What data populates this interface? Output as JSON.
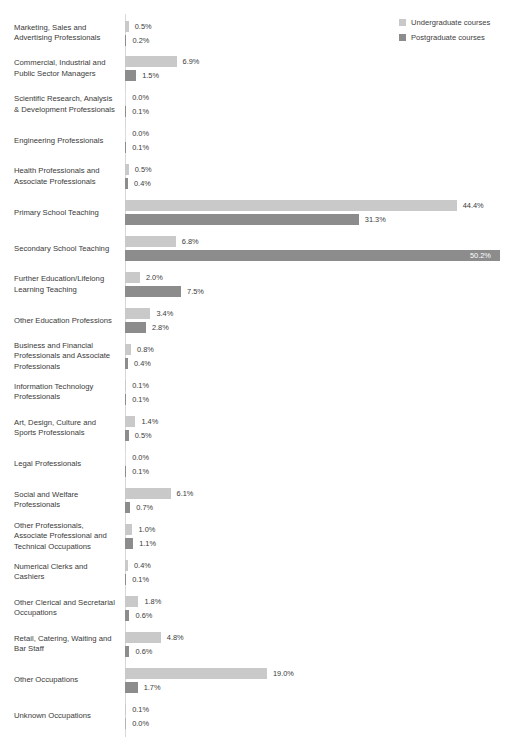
{
  "chart_data": {
    "type": "bar",
    "orientation": "horizontal",
    "title": "",
    "subtitle": "",
    "xlabel": "",
    "ylabel": "",
    "xlim": [
      0,
      50.2
    ],
    "grid": false,
    "value_suffix": "%",
    "legend_position": "top-right",
    "legend": [
      "Undergraduate courses",
      "Postgraduate courses"
    ],
    "colors": {
      "undergraduate": "#c9c9c9",
      "postgraduate": "#8c8c8c",
      "label_text": "#3a3a3a",
      "axis_line": "#d8d8d8",
      "inside_label_text": "#ffffff"
    },
    "categories": [
      "Marketing, Sales and Advertising Professionals",
      "Commercial, Industrial and Public Sector Managers",
      "Scientific Research, Analysis & Development Professionals",
      "Engineering Professionals",
      "Health Professionals and Associate Professionals",
      "Primary School Teaching",
      "Secondary School Teaching",
      "Further Education/Lifelong Learning Teaching",
      "Other Education Professions",
      "Business and Financial Professionals and Associate Professionals",
      "Information Technology Professionals",
      "Art, Design, Culture and Sports Professionals",
      "Legal Professionals",
      "Social and Welfare Professionals",
      "Other Professionals, Associate Professional and Technical Occupations",
      "Numerical Clerks and Cashiers",
      "Other Clerical and Secretarial Occupations",
      "Retail, Catering, Waiting and Bar Staff",
      "Other Occupations",
      "Unknown Occupations"
    ],
    "series": [
      {
        "name": "Undergraduate courses",
        "key": "undergraduate",
        "values": [
          0.5,
          6.9,
          0.0,
          0.0,
          0.5,
          44.4,
          6.8,
          2.0,
          3.4,
          0.8,
          0.1,
          1.4,
          0.0,
          6.1,
          1.0,
          0.4,
          1.8,
          4.8,
          19.0,
          0.1
        ],
        "labels": [
          "0.5%",
          "6.9%",
          "0.0%",
          "0.0%",
          "0.5%",
          "44.4%",
          "6.8%",
          "2.0%",
          "3.4%",
          "0.8%",
          "0.1%",
          "1.4%",
          "0.0%",
          "6.1%",
          "1.0%",
          "0.4%",
          "1.8%",
          "4.8%",
          "19.0%",
          "0.1%"
        ]
      },
      {
        "name": "Postgraduate courses",
        "key": "postgraduate",
        "values": [
          0.2,
          1.5,
          0.1,
          0.1,
          0.4,
          31.3,
          50.2,
          7.5,
          2.8,
          0.4,
          0.1,
          0.5,
          0.1,
          0.7,
          1.1,
          0.1,
          0.6,
          0.6,
          1.7,
          0.0
        ],
        "labels": [
          "0.2%",
          "1.5%",
          "0.1%",
          "0.1%",
          "0.4%",
          "31.3%",
          "50.2%",
          "7.5%",
          "2.8%",
          "0.4%",
          "0.1%",
          "0.5%",
          "0.1%",
          "0.7%",
          "1.1%",
          "0.1%",
          "0.6%",
          "0.6%",
          "1.7%",
          "0.0%"
        ]
      }
    ]
  },
  "legend": {
    "items": [
      {
        "label": "Undergraduate courses",
        "color": "#c9c9c9"
      },
      {
        "label": "Postgraduate courses",
        "color": "#8c8c8c"
      }
    ]
  },
  "layout": {
    "plot_left": 125,
    "first_row_top": 19,
    "row_step": 35.95,
    "bar_height": 11,
    "px_per_percent": 7.47,
    "label_gap": 6,
    "inside_label_threshold": 48
  }
}
